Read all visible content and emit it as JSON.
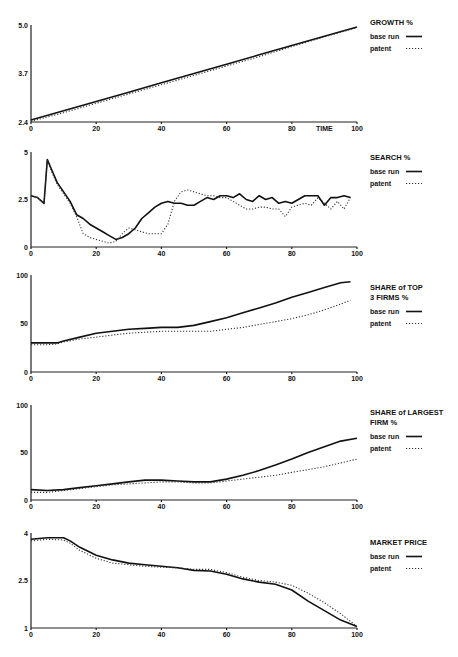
{
  "chart_data": [
    {
      "type": "line",
      "title": "GROWTH %",
      "xlabel": "TIME",
      "ylabel": "",
      "xlim": [
        0,
        100
      ],
      "ylim": [
        2.4,
        5.0
      ],
      "x_ticks": [
        "0",
        "20",
        "40",
        "60",
        "80",
        "TIME",
        "100"
      ],
      "y_ticks": [
        "5.0",
        "3.7",
        "2.4"
      ],
      "legend": [
        "base run",
        "patent"
      ],
      "legend_position": "right",
      "x": [
        0,
        10,
        20,
        30,
        40,
        50,
        60,
        70,
        80,
        90,
        100
      ],
      "series": [
        {
          "name": "base run",
          "style": "solid",
          "values": [
            2.45,
            2.7,
            2.95,
            3.2,
            3.45,
            3.7,
            3.95,
            4.2,
            4.45,
            4.7,
            4.95
          ]
        },
        {
          "name": "patent",
          "style": "dotted",
          "values": [
            2.42,
            2.65,
            2.9,
            3.15,
            3.4,
            3.65,
            3.9,
            4.15,
            4.42,
            4.68,
            4.93
          ]
        }
      ]
    },
    {
      "type": "line",
      "title": "SEARCH %",
      "xlabel": "",
      "ylabel": "",
      "xlim": [
        0,
        100
      ],
      "ylim": [
        0,
        5
      ],
      "x_ticks": [
        "0",
        "20",
        "40",
        "60",
        "80",
        "100"
      ],
      "y_ticks": [
        "5",
        "2.5",
        "0"
      ],
      "legend": [
        "base run",
        "patent"
      ],
      "legend_position": "right",
      "x": [
        0,
        2,
        4,
        5,
        6,
        8,
        10,
        12,
        14,
        16,
        18,
        20,
        22,
        24,
        26,
        28,
        30,
        32,
        34,
        36,
        38,
        40,
        42,
        44,
        46,
        48,
        50,
        52,
        54,
        56,
        58,
        60,
        62,
        64,
        66,
        68,
        70,
        72,
        74,
        76,
        78,
        80,
        82,
        84,
        86,
        88,
        90,
        92,
        94,
        96,
        98
      ],
      "series": [
        {
          "name": "base run",
          "style": "solid",
          "values": [
            2.7,
            2.6,
            2.3,
            4.6,
            4.2,
            3.4,
            2.9,
            2.4,
            1.7,
            1.5,
            1.2,
            1.0,
            0.8,
            0.6,
            0.4,
            0.5,
            0.7,
            1.0,
            1.5,
            1.8,
            2.1,
            2.3,
            2.4,
            2.3,
            2.3,
            2.2,
            2.2,
            2.4,
            2.6,
            2.5,
            2.7,
            2.7,
            2.6,
            2.8,
            2.5,
            2.4,
            2.7,
            2.5,
            2.6,
            2.3,
            2.4,
            2.3,
            2.5,
            2.7,
            2.7,
            2.7,
            2.2,
            2.6,
            2.6,
            2.7,
            2.6
          ]
        },
        {
          "name": "patent",
          "style": "dotted",
          "values": [
            2.7,
            2.6,
            2.3,
            4.6,
            4.1,
            3.3,
            2.8,
            2.3,
            1.6,
            0.7,
            0.5,
            0.4,
            0.3,
            0.2,
            0.3,
            0.7,
            1.0,
            0.9,
            0.8,
            0.7,
            0.7,
            0.7,
            1.2,
            2.4,
            2.9,
            3.0,
            2.9,
            2.8,
            2.7,
            2.7,
            2.6,
            2.6,
            2.4,
            2.2,
            2.0,
            2.0,
            2.1,
            2.1,
            2.0,
            2.0,
            1.6,
            2.1,
            2.2,
            2.3,
            2.2,
            2.6,
            2.3,
            2.0,
            2.4,
            2.0,
            2.6
          ]
        }
      ]
    },
    {
      "type": "line",
      "title": "SHARE of TOP 3 FIRMS %",
      "xlabel": "",
      "ylabel": "",
      "xlim": [
        0,
        100
      ],
      "ylim": [
        0,
        100
      ],
      "x_ticks": [
        "0",
        "20",
        "40",
        "60",
        "80",
        "100"
      ],
      "y_ticks": [
        "100",
        "50",
        "0"
      ],
      "legend": [
        "base run",
        "patent"
      ],
      "legend_position": "right",
      "x": [
        0,
        5,
        8,
        10,
        15,
        20,
        25,
        30,
        35,
        40,
        45,
        50,
        55,
        60,
        65,
        70,
        75,
        80,
        85,
        90,
        95,
        98
      ],
      "series": [
        {
          "name": "base run",
          "style": "solid",
          "values": [
            30,
            30,
            30,
            32,
            36,
            40,
            42,
            44,
            45,
            46,
            46,
            48,
            52,
            56,
            61,
            66,
            71,
            77,
            82,
            87,
            92,
            93
          ]
        },
        {
          "name": "patent",
          "style": "dotted",
          "values": [
            28,
            28,
            29,
            31,
            34,
            36,
            38,
            40,
            41,
            42,
            42,
            42,
            42,
            44,
            46,
            49,
            52,
            55,
            59,
            64,
            70,
            74
          ]
        }
      ]
    },
    {
      "type": "line",
      "title": "SHARE of LARGEST FIRM %",
      "xlabel": "",
      "ylabel": "",
      "xlim": [
        0,
        100
      ],
      "ylim": [
        0,
        100
      ],
      "x_ticks": [
        "0",
        "20",
        "40",
        "60",
        "80",
        "100"
      ],
      "y_ticks": [
        "100",
        "50",
        "0"
      ],
      "legend": [
        "base run",
        "patent"
      ],
      "legend_position": "right",
      "x": [
        0,
        5,
        10,
        15,
        20,
        25,
        30,
        35,
        40,
        45,
        50,
        55,
        60,
        65,
        70,
        75,
        80,
        85,
        90,
        95,
        100
      ],
      "series": [
        {
          "name": "base run",
          "style": "solid",
          "values": [
            11,
            10,
            11,
            13,
            15,
            17,
            19,
            21,
            21,
            20,
            19,
            19,
            22,
            26,
            31,
            37,
            43,
            50,
            56,
            62,
            65
          ]
        },
        {
          "name": "patent",
          "style": "dotted",
          "values": [
            8,
            8,
            10,
            12,
            14,
            16,
            17,
            18,
            19,
            19,
            18,
            18,
            20,
            22,
            24,
            26,
            29,
            32,
            35,
            39,
            43
          ]
        }
      ]
    },
    {
      "type": "line",
      "title": "MARKET PRICE",
      "xlabel": "",
      "ylabel": "",
      "xlim": [
        0,
        100
      ],
      "ylim": [
        1,
        4
      ],
      "x_ticks": [
        "0",
        "20",
        "40",
        "60",
        "80",
        "100"
      ],
      "y_ticks": [
        "4",
        "2.5",
        "1"
      ],
      "legend": [
        "base run",
        "patent"
      ],
      "legend_position": "right",
      "x": [
        0,
        5,
        10,
        12,
        15,
        20,
        25,
        30,
        35,
        40,
        45,
        50,
        55,
        60,
        65,
        70,
        75,
        80,
        85,
        90,
        95,
        100
      ],
      "series": [
        {
          "name": "base run",
          "style": "solid",
          "values": [
            3.8,
            3.85,
            3.85,
            3.75,
            3.55,
            3.3,
            3.15,
            3.05,
            3.0,
            2.95,
            2.9,
            2.82,
            2.8,
            2.7,
            2.55,
            2.45,
            2.38,
            2.2,
            1.85,
            1.55,
            1.25,
            1.05
          ]
        },
        {
          "name": "patent",
          "style": "dotted",
          "values": [
            3.75,
            3.8,
            3.78,
            3.68,
            3.45,
            3.2,
            3.05,
            3.0,
            2.95,
            2.92,
            2.9,
            2.85,
            2.85,
            2.75,
            2.6,
            2.5,
            2.45,
            2.35,
            2.1,
            1.8,
            1.45,
            1.05
          ]
        }
      ]
    }
  ]
}
